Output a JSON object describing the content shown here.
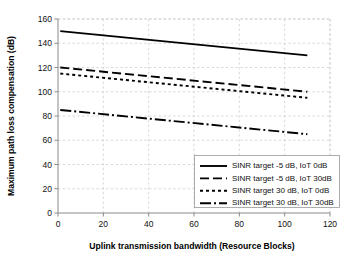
{
  "chart_data": {
    "type": "line",
    "title": "",
    "xlabel": "Uplink transmission bandwidth (Resource Blocks)",
    "ylabel": "Maximum path loss compensation (dB)",
    "xlim": [
      0,
      120
    ],
    "ylim": [
      0,
      160
    ],
    "xticks": [
      0,
      20,
      40,
      60,
      80,
      100,
      120
    ],
    "yticks": [
      0,
      20,
      40,
      60,
      80,
      100,
      120,
      140,
      160
    ],
    "xtick_labels": [
      "0",
      "20",
      "40",
      "60",
      "80",
      "100",
      "120"
    ],
    "ytick_labels": [
      "0",
      "20",
      "40",
      "60",
      "80",
      "100",
      "120",
      "140",
      "160"
    ],
    "grid": true,
    "grid_style": "dotted",
    "legend_position": "lower right",
    "series": [
      {
        "name": "SINR target -5 dB, IoT 0dB",
        "style": "solid",
        "dash": "none",
        "color": "#000000",
        "x": [
          1,
          110
        ],
        "values": [
          150,
          130
        ]
      },
      {
        "name": "SINR target -5 dB, IoT 30dB",
        "style": "dashed",
        "dash": "9 4",
        "color": "#000000",
        "x": [
          1,
          110
        ],
        "values": [
          120,
          100
        ]
      },
      {
        "name": "SINR target 30 dB, IoT 0dB",
        "style": "dotted",
        "dash": "3 3",
        "color": "#000000",
        "x": [
          1,
          110
        ],
        "values": [
          115,
          95
        ]
      },
      {
        "name": "SINR target 30 dB, IoT 30dB",
        "style": "dash-dot",
        "dash": "11 3 2 3",
        "color": "#000000",
        "x": [
          1,
          110
        ],
        "values": [
          85,
          65
        ]
      }
    ]
  },
  "legend": {
    "entries": [
      {
        "label": "SINR target -5 dB, IoT 0dB",
        "dash": "none"
      },
      {
        "label": "SINR target -5 dB, IoT 30dB",
        "dash": "9 4"
      },
      {
        "label": "SINR target 30 dB, IoT 0dB",
        "dash": "3 3"
      },
      {
        "label": "SINR target 30 dB, IoT 30dB",
        "dash": "11 3 2 3"
      }
    ]
  }
}
